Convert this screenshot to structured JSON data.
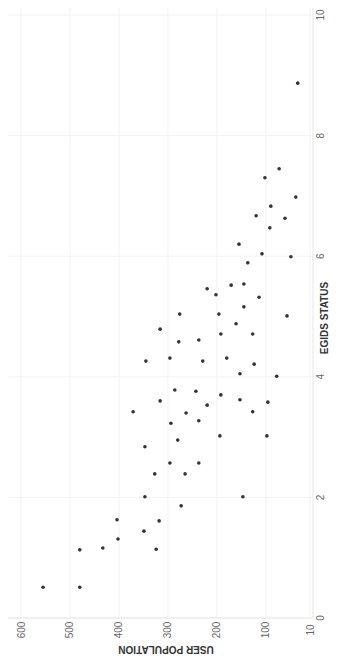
{
  "chart_data": {
    "type": "scatter",
    "orientation": "rotated-90-clockwise",
    "title": "",
    "xlabel": "EGIDS STATUS",
    "ylabel": "USER POPULATION",
    "xlim": [
      0,
      10
    ],
    "ylim": [
      10,
      600
    ],
    "x_ticks": [
      "0",
      "2",
      "4",
      "6",
      "8",
      "10"
    ],
    "x_tick_values": [
      0,
      2,
      4,
      6,
      8,
      10
    ],
    "y_ticks": [
      "10",
      "100",
      "200",
      "300",
      "400",
      "500",
      "600"
    ],
    "y_tick_values": [
      10,
      100,
      200,
      300,
      400,
      500,
      600
    ],
    "grid": true,
    "legend": "none",
    "point_color": "#333333",
    "points": [
      {
        "x": 0.51,
        "y": 555
      },
      {
        "x": 0.51,
        "y": 480
      },
      {
        "x": 1.13,
        "y": 480
      },
      {
        "x": 1.16,
        "y": 433
      },
      {
        "x": 1.63,
        "y": 404
      },
      {
        "x": 1.31,
        "y": 402
      },
      {
        "x": 1.44,
        "y": 349
      },
      {
        "x": 1.14,
        "y": 324
      },
      {
        "x": 1.61,
        "y": 318
      },
      {
        "x": 2.01,
        "y": 347
      },
      {
        "x": 1.86,
        "y": 273
      },
      {
        "x": 2.39,
        "y": 327
      },
      {
        "x": 2.39,
        "y": 265
      },
      {
        "x": 2.57,
        "y": 296
      },
      {
        "x": 2.57,
        "y": 237
      },
      {
        "x": 2.84,
        "y": 347
      },
      {
        "x": 2.95,
        "y": 280
      },
      {
        "x": 3.02,
        "y": 194
      },
      {
        "x": 3.02,
        "y": 98
      },
      {
        "x": 3.23,
        "y": 294
      },
      {
        "x": 3.27,
        "y": 237
      },
      {
        "x": 3.42,
        "y": 371
      },
      {
        "x": 3.4,
        "y": 263
      },
      {
        "x": 3.6,
        "y": 316
      },
      {
        "x": 3.53,
        "y": 220
      },
      {
        "x": 3.7,
        "y": 192
      },
      {
        "x": 3.62,
        "y": 153
      },
      {
        "x": 3.58,
        "y": 96
      },
      {
        "x": 3.42,
        "y": 127
      },
      {
        "x": 3.76,
        "y": 243
      },
      {
        "x": 3.78,
        "y": 286
      },
      {
        "x": 4.26,
        "y": 345
      },
      {
        "x": 4.31,
        "y": 296
      },
      {
        "x": 4.26,
        "y": 229
      },
      {
        "x": 4.31,
        "y": 180
      },
      {
        "x": 4.21,
        "y": 124
      },
      {
        "x": 4.05,
        "y": 153
      },
      {
        "x": 4.01,
        "y": 78
      },
      {
        "x": 2.01,
        "y": 147
      },
      {
        "x": 4.79,
        "y": 316
      },
      {
        "x": 4.58,
        "y": 278
      },
      {
        "x": 4.61,
        "y": 237
      },
      {
        "x": 4.71,
        "y": 192
      },
      {
        "x": 4.71,
        "y": 127
      },
      {
        "x": 5.04,
        "y": 276
      },
      {
        "x": 5.04,
        "y": 196
      },
      {
        "x": 5.46,
        "y": 220
      },
      {
        "x": 5.36,
        "y": 202
      },
      {
        "x": 5.52,
        "y": 171
      },
      {
        "x": 5.54,
        "y": 145
      },
      {
        "x": 5.32,
        "y": 114
      },
      {
        "x": 5.16,
        "y": 145
      },
      {
        "x": 4.88,
        "y": 161
      },
      {
        "x": 5.01,
        "y": 57
      },
      {
        "x": 6.2,
        "y": 155
      },
      {
        "x": 5.89,
        "y": 137
      },
      {
        "x": 6.04,
        "y": 108
      },
      {
        "x": 5.99,
        "y": 49
      },
      {
        "x": 6.67,
        "y": 120
      },
      {
        "x": 6.63,
        "y": 61
      },
      {
        "x": 6.47,
        "y": 92
      },
      {
        "x": 6.83,
        "y": 90
      },
      {
        "x": 7.3,
        "y": 102
      },
      {
        "x": 7.45,
        "y": 73
      },
      {
        "x": 6.98,
        "y": 39
      },
      {
        "x": 8.87,
        "y": 35
      }
    ]
  }
}
